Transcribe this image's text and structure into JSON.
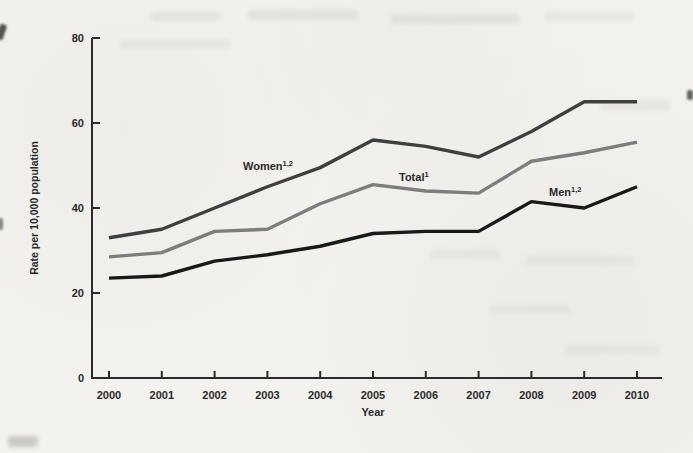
{
  "page": {
    "background": "#f3f2ee",
    "type_label": "scanned line chart"
  },
  "chart_data": {
    "type": "line",
    "title": "",
    "xlabel": "Year",
    "ylabel": "Rate per 10,000 population",
    "x": [
      2000,
      2001,
      2002,
      2003,
      2004,
      2005,
      2006,
      2007,
      2008,
      2009,
      2010
    ],
    "x_tick_labels": [
      "2000",
      "2001",
      "2002",
      "2003",
      "2004",
      "2005",
      "2006",
      "2007",
      "2008",
      "2009",
      "2010"
    ],
    "ylim": [
      0,
      80
    ],
    "yticks": [
      0,
      20,
      40,
      60,
      80
    ],
    "y_tick_labels": [
      "0",
      "20",
      "40",
      "60",
      "80"
    ],
    "grid": false,
    "legend_position": "inline-labels",
    "axis_color": "#2b2b2b",
    "text_color": "#2a2a2a",
    "series": [
      {
        "name": "women",
        "label": "Women",
        "superscript": "1,2",
        "color": "#3f3f3f",
        "values": [
          33,
          35,
          40,
          45,
          49.5,
          56,
          54.5,
          52,
          58,
          65,
          65
        ]
      },
      {
        "name": "total",
        "label": "Total",
        "superscript": "1",
        "color": "#7d7d7d",
        "values": [
          28.5,
          29.5,
          34.5,
          35,
          41,
          45.5,
          44,
          43.5,
          51,
          53,
          55.5
        ]
      },
      {
        "name": "men",
        "label": "Men",
        "superscript": "1,2",
        "color": "#191919",
        "values": [
          23.5,
          24,
          27.5,
          29,
          31,
          34,
          34.5,
          34.5,
          41.5,
          40,
          45
        ]
      }
    ]
  }
}
